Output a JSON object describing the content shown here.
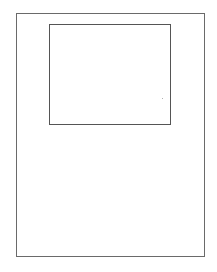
{
  "diagram": {
    "outer_frame": {
      "x": 16,
      "y": 13,
      "width": 188,
      "height": 244,
      "stroke": "#6a6a6a"
    },
    "inner_frame": {
      "x": 49,
      "y": 24,
      "width": 121,
      "height": 100,
      "stroke": "#555555"
    },
    "marks": [
      {
        "x": 162,
        "y": 98,
        "color": "#b0b0b0"
      }
    ]
  }
}
